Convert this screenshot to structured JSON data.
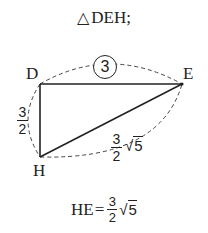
{
  "title": {
    "symbol": "△",
    "text": "DEH",
    "punct": ";"
  },
  "figure": {
    "vertices": {
      "D": {
        "label": "D",
        "x": 40,
        "y": 84
      },
      "E": {
        "label": "E",
        "x": 182,
        "y": 84
      },
      "H": {
        "label": "H",
        "x": 40,
        "y": 157
      }
    },
    "sides": {
      "DE": {
        "label": "3",
        "style": "circled"
      },
      "DH": {
        "numerator": "3",
        "denominator": "2"
      },
      "HE": {
        "numerator": "3",
        "denominator": "2",
        "radical": "5",
        "radical_sign": "√"
      }
    }
  },
  "result": {
    "lhs": "HE",
    "eq": "=",
    "numerator": "3",
    "denominator": "2",
    "radical_sign": "√",
    "radical": "5"
  }
}
